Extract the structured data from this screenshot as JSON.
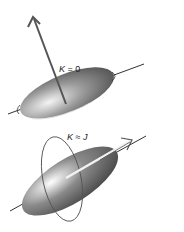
{
  "diagram": {
    "panels": [
      {
        "label_k": "K",
        "label_rel": " = ",
        "label_val": "0"
      },
      {
        "label_k": "K",
        "label_rel": " ≈ ",
        "label_val": "J"
      }
    ]
  }
}
